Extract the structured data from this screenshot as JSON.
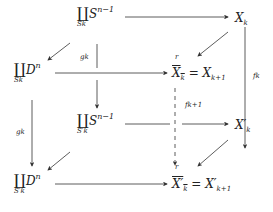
{
  "diagram": {
    "type": "commutative-diagram",
    "nodes": {
      "top_left_coprod": {
        "symbol": "∐",
        "sub": "S_k",
        "sub_text": "Sk",
        "base": "S",
        "sup": "n−1"
      },
      "top_right": {
        "base": "X",
        "sub": "k"
      },
      "mid_left_coprod": {
        "symbol": "∐",
        "sub_text": "Sk",
        "base": "D",
        "sup": "n"
      },
      "mid_center": {
        "lhs_base": "X",
        "lhs_sub": "k",
        "eq": "=",
        "rhs_base": "X",
        "rhs_sub": "k+1",
        "mark": "r"
      },
      "lower_center_coprod": {
        "symbol": "∐",
        "sub_text": "S′k",
        "base": "S",
        "sup": "n−1"
      },
      "lower_right": {
        "base": "X′",
        "sub": "k"
      },
      "bottom_left_coprod": {
        "symbol": "∐",
        "sub_text": "S′k",
        "base": "D",
        "sup": "n"
      },
      "bottom_center": {
        "lhs_base": "X′",
        "lhs_sub": "k",
        "eq": "=",
        "rhs_base": "X′",
        "rhs_sub": "k+1",
        "mark": "r"
      }
    },
    "labels": {
      "g_upper": "gk",
      "g_left": "gk",
      "f_right": "fk",
      "f_dashed": "fk+1"
    },
    "edges": [
      {
        "from": "top_left_coprod",
        "to": "top_right",
        "style": "solid"
      },
      {
        "from": "top_left_coprod",
        "to": "mid_left_coprod",
        "style": "solid"
      },
      {
        "from": "top_right",
        "to": "mid_center",
        "style": "solid"
      },
      {
        "from": "top_right",
        "to": "lower_right",
        "style": "solid",
        "label": "fk"
      },
      {
        "from": "mid_left_coprod",
        "to": "mid_center",
        "style": "solid"
      },
      {
        "from": "top_left_coprod",
        "to": "lower_center_coprod",
        "style": "solid",
        "label": "gk"
      },
      {
        "from": "mid_left_coprod",
        "to": "bottom_left_coprod",
        "style": "solid",
        "label": "gk"
      },
      {
        "from": "mid_center",
        "to": "bottom_center",
        "style": "dashed",
        "label": "fk+1"
      },
      {
        "from": "lower_center_coprod",
        "to": "lower_right",
        "style": "solid"
      },
      {
        "from": "lower_center_coprod",
        "to": "bottom_left_coprod",
        "style": "solid"
      },
      {
        "from": "lower_right",
        "to": "bottom_center",
        "style": "solid"
      },
      {
        "from": "bottom_left_coprod",
        "to": "bottom_center",
        "style": "solid"
      }
    ]
  }
}
